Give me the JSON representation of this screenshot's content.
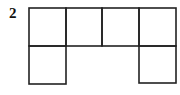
{
  "figure": {
    "label": "2",
    "stroke_color": "#222222",
    "grid": {
      "columns": 4,
      "rows": 2,
      "cells": [
        {
          "row": 0,
          "col": 0,
          "filled": true
        },
        {
          "row": 0,
          "col": 1,
          "filled": true
        },
        {
          "row": 0,
          "col": 2,
          "filled": true
        },
        {
          "row": 0,
          "col": 3,
          "filled": true
        },
        {
          "row": 1,
          "col": 0,
          "filled": true
        },
        {
          "row": 1,
          "col": 3,
          "filled": true
        }
      ]
    }
  }
}
